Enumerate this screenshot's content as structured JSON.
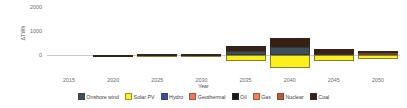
{
  "chart_data": {
    "type": "bar",
    "stacked": true,
    "title": "",
    "subtitle": "",
    "xlabel": "Year",
    "ylabel": "ΔTWh",
    "categories": [
      "2015",
      "2020",
      "2025",
      "2030",
      "2035",
      "2040",
      "2045",
      "2050"
    ],
    "x_tick_labels": [
      "2015",
      "2020",
      "2025",
      "2030",
      "2035",
      "2040",
      "2045",
      "2050"
    ],
    "y_tick_labels": [
      "2000",
      "1000",
      "0"
    ],
    "y_tick_values": [
      2000,
      1000,
      0
    ],
    "ylim": [
      -700,
      2150
    ],
    "xlim_note": "categorical, 2015 through 2050 in 5-year steps",
    "grid": false,
    "legend_position": "bottom",
    "series": [
      {
        "name": "Onshore wind",
        "color": "#3d4f5c",
        "values": [
          0,
          5,
          10,
          20,
          180,
          350,
          40,
          10
        ]
      },
      {
        "name": "Solar PV",
        "color": "#fdee1e",
        "values": [
          0,
          -8,
          -20,
          -60,
          -260,
          -530,
          -250,
          -175
        ]
      },
      {
        "name": "Hydro",
        "color": "#3b4ba8",
        "values": [
          0,
          0,
          0,
          0,
          0,
          0,
          0,
          0
        ]
      },
      {
        "name": "Geothermal",
        "color": "#ef7a52",
        "values": [
          0,
          0,
          0,
          0,
          0,
          0,
          0,
          0
        ]
      },
      {
        "name": "Oil",
        "color": "#17181a",
        "values": [
          0,
          0,
          0,
          0,
          0,
          0,
          0,
          0
        ]
      },
      {
        "name": "Gas",
        "color": "#f4804d",
        "values": [
          0,
          0,
          0,
          0,
          0,
          0,
          0,
          0
        ]
      },
      {
        "name": "Nuclear",
        "color": "#c0573a",
        "values": [
          0,
          0,
          0,
          0,
          0,
          0,
          0,
          85
        ]
      },
      {
        "name": "Coal",
        "color": "#3a1f12",
        "values": [
          0,
          18,
          25,
          55,
          195,
          380,
          245,
          70
        ]
      }
    ]
  },
  "legend": {
    "items": [
      {
        "label": "Onshore wind",
        "color": "#3d4f5c"
      },
      {
        "label": "Solar PV",
        "color": "#fdee1e"
      },
      {
        "label": "Hydro",
        "color": "#3b4ba8"
      },
      {
        "label": "Geothermal",
        "color": "#ef7a52"
      },
      {
        "label": "Oil",
        "color": "#17181a"
      },
      {
        "label": "Gas",
        "color": "#f4804d"
      },
      {
        "label": "Nuclear",
        "color": "#c0573a"
      },
      {
        "label": "Coal",
        "color": "#3a1f12"
      }
    ]
  }
}
